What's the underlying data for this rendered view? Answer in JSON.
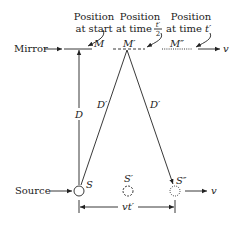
{
  "diagram": {
    "labels": {
      "position_start_line1": "Position",
      "position_start_line2": "at start",
      "position_half_line1": "Position",
      "position_half_line2": "at time",
      "position_half_frac_num": "t′",
      "position_half_frac_den": "2",
      "position_full_line1": "Position",
      "position_full_line2": "at time",
      "position_full_time": "t′",
      "mirror": "Mirror",
      "source": "Source",
      "m": "M",
      "m_prime": "M′",
      "m_double_prime": "M″",
      "velocity_top": "v",
      "velocity_bottom": "v",
      "distance_d": "D",
      "distance_d_prime_left": "D′",
      "distance_d_prime_right": "D′",
      "s": "S",
      "s_prime": "S′",
      "s_double_prime": "S″",
      "vt_prime": "vt′"
    },
    "colors": {
      "ink": "#222222",
      "background": "#ffffff"
    }
  }
}
